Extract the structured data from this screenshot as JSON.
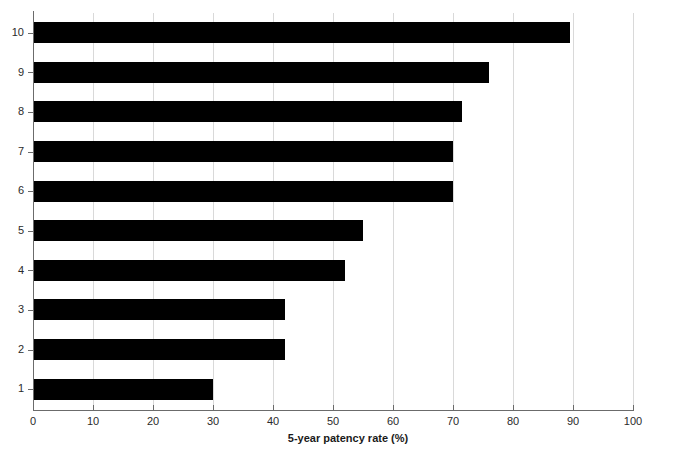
{
  "chart_data": {
    "type": "bar",
    "orientation": "horizontal",
    "title": "",
    "xlabel": "5-year patency rate (%)",
    "ylabel": "",
    "categories": [
      "1",
      "2",
      "3",
      "4",
      "5",
      "6",
      "7",
      "8",
      "9",
      "10"
    ],
    "values": [
      30,
      42,
      42,
      52,
      55,
      70,
      70,
      71.5,
      76,
      89.5
    ],
    "xlim": [
      0,
      100
    ],
    "xticks": [
      0,
      10,
      20,
      30,
      40,
      50,
      60,
      70,
      80,
      90,
      100
    ],
    "xticklabels": [
      "0",
      "10",
      "20",
      "30",
      "40",
      "50",
      "60",
      "70",
      "80",
      "90",
      "100"
    ],
    "yticklabels": [
      "10",
      "9",
      "8",
      "7",
      "6",
      "5",
      "4",
      "3",
      "2",
      "1"
    ],
    "grid": "vertical",
    "legend": "none",
    "bar_color": "#000000",
    "gridline_color": "#d9d9d9",
    "axis_color": "#6b6b6b",
    "background_color": "#ffffff",
    "series": [
      {
        "name": "5-year patency rate (%)",
        "values": [
          30,
          42,
          42,
          52,
          55,
          70,
          70,
          71.5,
          76,
          89.5
        ]
      }
    ]
  },
  "axis": {
    "x_title": "5-year patency rate (%)"
  }
}
